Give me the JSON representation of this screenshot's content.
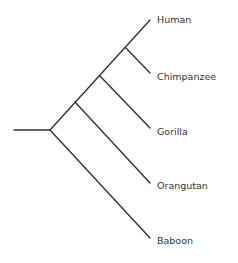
{
  "diagram": {
    "type": "phylogenetic-tree",
    "line_color": "#333333",
    "text_color": "#333333",
    "root": {
      "stem_start": [
        14,
        130
      ],
      "node": [
        50,
        130
      ]
    },
    "internal_nodes": [
      {
        "id": "n1",
        "pos": [
          126,
          48
        ],
        "children": [
          "Human",
          "Chimpanzee"
        ]
      },
      {
        "id": "n2",
        "pos": [
          100,
          76
        ],
        "children": [
          "n1",
          "Gorilla"
        ]
      },
      {
        "id": "n3",
        "pos": [
          75,
          102
        ],
        "children": [
          "n2",
          "Orangutan"
        ]
      },
      {
        "id": "root",
        "pos": [
          50,
          130
        ],
        "children": [
          "n3",
          "Baboon"
        ]
      }
    ],
    "taxa": [
      {
        "label": "Human",
        "tip": [
          150,
          20
        ]
      },
      {
        "label": "Chimpanzee",
        "tip": [
          150,
          73
        ]
      },
      {
        "label": "Gorilla",
        "tip": [
          150,
          128
        ]
      },
      {
        "label": "Orangutan",
        "tip": [
          150,
          183
        ]
      },
      {
        "label": "Baboon",
        "tip": [
          150,
          238
        ]
      }
    ]
  }
}
